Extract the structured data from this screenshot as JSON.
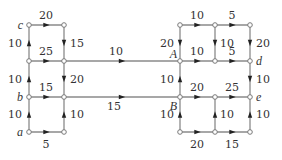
{
  "diagram": {
    "type": "directed weighted network",
    "nodes": [
      {
        "id": "c",
        "label": "c",
        "x": 29,
        "y": 25
      },
      {
        "id": "n2",
        "label": "",
        "x": 64,
        "y": 25
      },
      {
        "id": "n3",
        "label": "",
        "x": 29,
        "y": 61
      },
      {
        "id": "n4",
        "label": "",
        "x": 64,
        "y": 61
      },
      {
        "id": "b",
        "label": "b",
        "x": 29,
        "y": 97
      },
      {
        "id": "n6",
        "label": "",
        "x": 64,
        "y": 97
      },
      {
        "id": "a",
        "label": "a",
        "x": 29,
        "y": 132
      },
      {
        "id": "n8",
        "label": "",
        "x": 64,
        "y": 132
      },
      {
        "id": "n9",
        "label": "",
        "x": 180,
        "y": 25
      },
      {
        "id": "n10",
        "label": "",
        "x": 215,
        "y": 25
      },
      {
        "id": "n11",
        "label": "",
        "x": 250,
        "y": 25
      },
      {
        "id": "A",
        "label": "A",
        "x": 180,
        "y": 61
      },
      {
        "id": "n13",
        "label": "",
        "x": 215,
        "y": 61
      },
      {
        "id": "d",
        "label": "d",
        "x": 250,
        "y": 61
      },
      {
        "id": "B",
        "label": "B",
        "x": 180,
        "y": 97
      },
      {
        "id": "n16",
        "label": "",
        "x": 215,
        "y": 97
      },
      {
        "id": "e",
        "label": "e",
        "x": 250,
        "y": 97
      },
      {
        "id": "n18",
        "label": "",
        "x": 180,
        "y": 132
      },
      {
        "id": "n19",
        "label": "",
        "x": 215,
        "y": 132
      },
      {
        "id": "n20",
        "label": "",
        "x": 250,
        "y": 132
      }
    ],
    "edges": [
      {
        "from": "c",
        "to": "n2",
        "weight": "20",
        "lx": 46,
        "ly": 19,
        "anchor": "middle"
      },
      {
        "from": "n3",
        "to": "c",
        "weight": "10",
        "lx": 22,
        "ly": 47,
        "anchor": "end"
      },
      {
        "from": "n2",
        "to": "n4",
        "weight": "15",
        "lx": 70,
        "ly": 47,
        "anchor": "start"
      },
      {
        "from": "n3",
        "to": "n4",
        "weight": "25",
        "lx": 46,
        "ly": 55,
        "anchor": "middle"
      },
      {
        "from": "n4",
        "to": "A",
        "weight": "10",
        "lx": 116,
        "ly": 55,
        "anchor": "middle"
      },
      {
        "from": "b",
        "to": "n3",
        "weight": "10",
        "lx": 22,
        "ly": 83,
        "anchor": "end"
      },
      {
        "from": "n4",
        "to": "n6",
        "weight": "20",
        "lx": 70,
        "ly": 83,
        "anchor": "start"
      },
      {
        "from": "b",
        "to": "n6",
        "weight": "15",
        "lx": 46,
        "ly": 91,
        "anchor": "middle"
      },
      {
        "from": "n6",
        "to": "B",
        "weight": "15",
        "lx": 114,
        "ly": 110,
        "anchor": "middle"
      },
      {
        "from": "a",
        "to": "b",
        "weight": "10",
        "lx": 22,
        "ly": 118,
        "anchor": "end"
      },
      {
        "from": "n8",
        "to": "n6",
        "weight": "10",
        "lx": 70,
        "ly": 118,
        "anchor": "start"
      },
      {
        "from": "a",
        "to": "n8",
        "weight": "5",
        "lx": 46,
        "ly": 148,
        "anchor": "middle"
      },
      {
        "from": "n9",
        "to": "n10",
        "weight": "10",
        "lx": 197,
        "ly": 19,
        "anchor": "middle"
      },
      {
        "from": "n10",
        "to": "n11",
        "weight": "5",
        "lx": 232,
        "ly": 19,
        "anchor": "middle"
      },
      {
        "from": "n9",
        "to": "A",
        "weight": "20",
        "lx": 174,
        "ly": 47,
        "anchor": "end"
      },
      {
        "from": "n10",
        "to": "n13",
        "weight": "10",
        "lx": 220,
        "ly": 47,
        "anchor": "start"
      },
      {
        "from": "n11",
        "to": "d",
        "weight": "20",
        "lx": 256,
        "ly": 47,
        "anchor": "start"
      },
      {
        "from": "A",
        "to": "n13",
        "weight": "10",
        "lx": 197,
        "ly": 55,
        "anchor": "middle"
      },
      {
        "from": "n13",
        "to": "d",
        "weight": "5",
        "lx": 232,
        "ly": 55,
        "anchor": "middle"
      },
      {
        "from": "B",
        "to": "A",
        "weight": "10",
        "lx": 174,
        "ly": 83,
        "anchor": "end"
      },
      {
        "from": "d",
        "to": "e",
        "weight": "10",
        "lx": 256,
        "ly": 83,
        "anchor": "start"
      },
      {
        "from": "B",
        "to": "n16",
        "weight": "20",
        "lx": 197,
        "ly": 91,
        "anchor": "middle"
      },
      {
        "from": "n16",
        "to": "e",
        "weight": "25",
        "lx": 232,
        "ly": 91,
        "anchor": "middle"
      },
      {
        "from": "n18",
        "to": "B",
        "weight": "10",
        "lx": 174,
        "ly": 118,
        "anchor": "end"
      },
      {
        "from": "n19",
        "to": "n16",
        "weight": "10",
        "lx": 220,
        "ly": 118,
        "anchor": "start"
      },
      {
        "from": "n20",
        "to": "e",
        "weight": "10",
        "lx": 256,
        "ly": 118,
        "anchor": "start"
      },
      {
        "from": "n18",
        "to": "n19",
        "weight": "20",
        "lx": 197,
        "ly": 148,
        "anchor": "middle"
      },
      {
        "from": "n19",
        "to": "n20",
        "weight": "15",
        "lx": 232,
        "ly": 148,
        "anchor": "middle"
      }
    ],
    "node_label_offsets": {
      "c": {
        "dx": -6,
        "dy": 4,
        "anchor": "end"
      },
      "b": {
        "dx": -6,
        "dy": 4,
        "anchor": "end"
      },
      "a": {
        "dx": -6,
        "dy": 4,
        "anchor": "end"
      },
      "A": {
        "dx": -3,
        "dy": -3,
        "anchor": "end"
      },
      "B": {
        "dx": -3,
        "dy": 13,
        "anchor": "end"
      },
      "d": {
        "dx": 6,
        "dy": 4,
        "anchor": "start"
      },
      "e": {
        "dx": 6,
        "dy": 4,
        "anchor": "start"
      }
    },
    "colors": {
      "edge": "#8a8a8a",
      "node_stroke": "#7a7a7a",
      "arrow": "#222222",
      "text": "#333333"
    }
  }
}
